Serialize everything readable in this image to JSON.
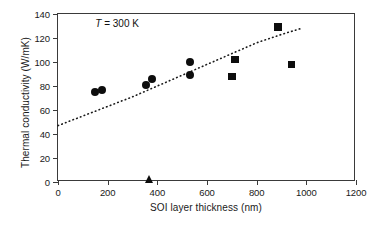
{
  "chart_data": {
    "type": "scatter",
    "title": "",
    "xlabel": "SOI layer thickness (nm)",
    "ylabel": "Thermal conductivity (W/mK)",
    "xlim": [
      0,
      1200
    ],
    "ylim": [
      0,
      140
    ],
    "xticks": [
      0,
      200,
      400,
      600,
      800,
      1000,
      1200
    ],
    "yticks": [
      0,
      20,
      40,
      60,
      80,
      100,
      120,
      140
    ],
    "xtick_labels": [
      "0",
      "200",
      "400",
      "600",
      "800",
      "1000",
      "1200"
    ],
    "ytick_labels": [
      "0",
      "20",
      "40",
      "60",
      "80",
      "100",
      "120",
      "140"
    ],
    "grid": false,
    "legend": "none",
    "annotations": [
      {
        "text_symbol": "T",
        "text_rest": " = 300 K",
        "x": 150,
        "y": 132
      }
    ],
    "series": [
      {
        "name": "circle-markers",
        "marker": "circle",
        "color": "#0d0d0d",
        "points": [
          {
            "x": 150,
            "y": 75
          },
          {
            "x": 178,
            "y": 77
          },
          {
            "x": 355,
            "y": 81
          },
          {
            "x": 378,
            "y": 86
          },
          {
            "x": 530,
            "y": 89
          },
          {
            "x": 533,
            "y": 100
          }
        ]
      },
      {
        "name": "square-markers",
        "marker": "square",
        "color": "#0d0d0d",
        "points": [
          {
            "x": 700,
            "y": 88
          },
          {
            "x": 712,
            "y": 102
          },
          {
            "x": 885,
            "y": 129
          },
          {
            "x": 940,
            "y": 98
          }
        ]
      },
      {
        "name": "triangle-marker",
        "marker": "triangle",
        "color": "#0d0d0d",
        "points": [
          {
            "x": 370,
            "y": 1
          }
        ]
      },
      {
        "name": "dotted-trend-line",
        "marker": "none",
        "style": "dotted",
        "color": "#1a1a1a",
        "points": [
          {
            "x": 0,
            "y": 47
          },
          {
            "x": 100,
            "y": 55
          },
          {
            "x": 200,
            "y": 63
          },
          {
            "x": 300,
            "y": 71
          },
          {
            "x": 400,
            "y": 80
          },
          {
            "x": 500,
            "y": 89
          },
          {
            "x": 600,
            "y": 98
          },
          {
            "x": 700,
            "y": 107
          },
          {
            "x": 800,
            "y": 116
          },
          {
            "x": 900,
            "y": 123
          },
          {
            "x": 980,
            "y": 128
          }
        ]
      }
    ]
  }
}
